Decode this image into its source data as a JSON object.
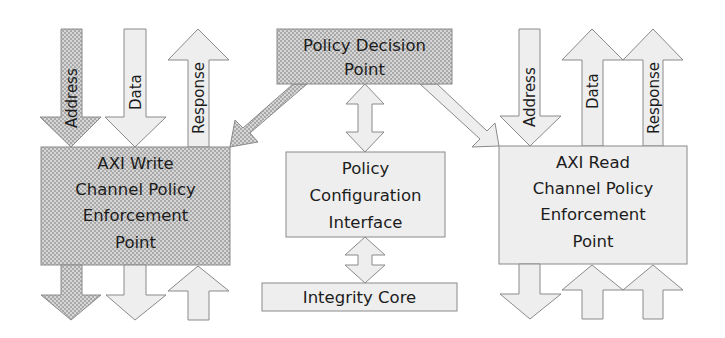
{
  "diagram": {
    "policy_decision_point": {
      "line1": "Policy Decision",
      "line2": "Point"
    },
    "policy_configuration_interface": {
      "line1": "Policy",
      "line2": "Configuration",
      "line3": "Interface"
    },
    "integrity_core": {
      "label": "Integrity Core"
    },
    "axi_write_pep": {
      "line1": "AXI Write",
      "line2": "Channel Policy",
      "line3": "Enforcement",
      "line4": "Point"
    },
    "axi_read_pep": {
      "line1": "AXI Read",
      "line2": "Channel Policy",
      "line3": "Enforcement",
      "line4": "Point"
    },
    "write_channel_arrows": {
      "address": "Address",
      "data": "Data",
      "response": "Response"
    },
    "read_channel_arrows": {
      "address": "Address",
      "data": "Data",
      "response": "Response"
    }
  },
  "colors": {
    "hatched_fill": "#c4c4c4",
    "light_fill": "#eeeeee",
    "stroke": "#8a8a8a",
    "text": "#1c1c1c"
  }
}
